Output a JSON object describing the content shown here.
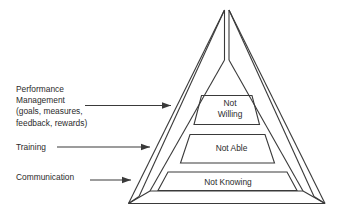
{
  "diagram": {
    "type": "pyramid",
    "title": "",
    "background_color": "#ffffff",
    "line_color": "#3a3a3a",
    "text_color": "#2b2b2b",
    "tiers": [
      {
        "id": "top",
        "label": "Not\nWilling",
        "label_line1": "Not",
        "label_line2": "Willing"
      },
      {
        "id": "middle",
        "label": "Not Able",
        "label_line1": "Not Able",
        "label_line2": ""
      },
      {
        "id": "bottom",
        "label": "Not Knowing",
        "label_line1": "Not Knowing",
        "label_line2": ""
      }
    ],
    "callouts": [
      {
        "id": "performance-management",
        "text": "Performance\nManagement\n(goals, measures,\nfeedback, rewards)",
        "points_to": "top",
        "arrow": true
      },
      {
        "id": "training",
        "text": "Training",
        "points_to": "middle",
        "arrow": true
      },
      {
        "id": "communication",
        "text": "Communication",
        "points_to": "bottom",
        "arrow": true
      }
    ]
  }
}
